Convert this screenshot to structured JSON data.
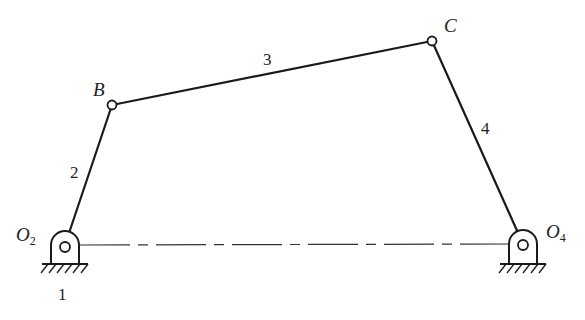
{
  "diagram": {
    "joints": {
      "O2": {
        "label": "O",
        "sub": "2",
        "x": 65,
        "y": 245
      },
      "B": {
        "label": "B",
        "x": 112,
        "y": 105
      },
      "C": {
        "label": "C",
        "x": 432,
        "y": 41
      },
      "O4": {
        "label": "O",
        "sub": "4",
        "x": 523,
        "y": 244
      }
    },
    "links": [
      {
        "id": "2",
        "label": "2",
        "from": "O2",
        "to": "B"
      },
      {
        "id": "3",
        "label": "3",
        "from": "B",
        "to": "C"
      },
      {
        "id": "4",
        "label": "4",
        "from": "C",
        "to": "O4"
      }
    ],
    "ground": {
      "label": "1"
    },
    "colors": {
      "line": "#1a1a1a",
      "background": "#ffffff"
    }
  }
}
